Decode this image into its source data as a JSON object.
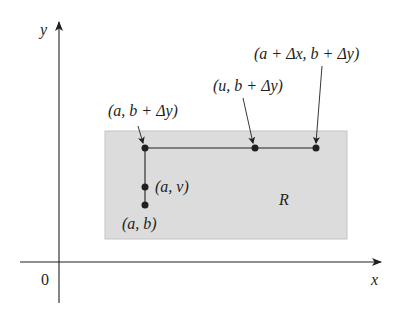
{
  "figure": {
    "axes": {
      "x_label": "x",
      "y_label": "y",
      "origin_label": "0"
    },
    "region": {
      "label": "R",
      "fill": "#dcdcdc",
      "stroke": "#c4c4c4"
    },
    "points": [
      {
        "id": "a-b",
        "label": "(a, b)"
      },
      {
        "id": "a-v",
        "label": "(a, v)"
      },
      {
        "id": "a-b-dy",
        "label": "(a, b + Δy)"
      },
      {
        "id": "u-b-dy",
        "label": "(u, b + Δy)"
      },
      {
        "id": "a-dx-b-dy",
        "label": "(a + Δx, b + Δy)"
      }
    ],
    "colors": {
      "ink": "#231f20",
      "background": "#ffffff"
    }
  }
}
